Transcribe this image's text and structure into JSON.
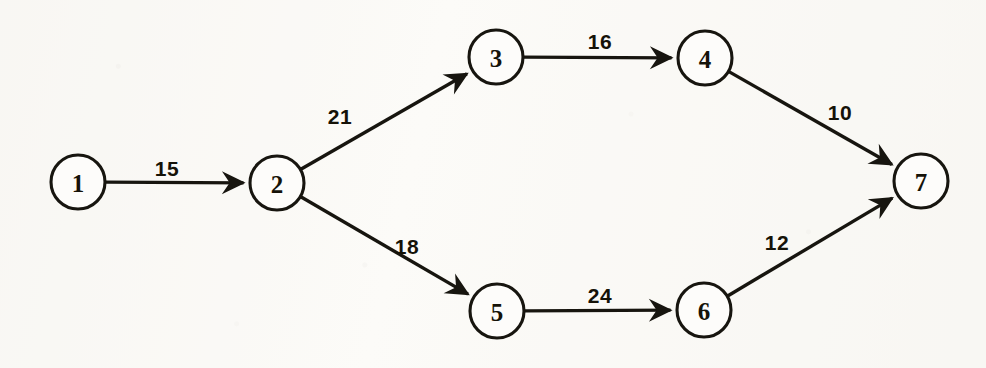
{
  "figure": {
    "kind": "directed-network-diagram",
    "canvas": {
      "width": 986,
      "height": 368
    },
    "background_color": "#fcfbf8",
    "ink_color": "#17150f"
  },
  "chart_data": {
    "type": "diagram",
    "title": "",
    "xlabel": "",
    "ylabel": "",
    "node_radius": 27,
    "nodes": [
      {
        "id": "1",
        "label": "1",
        "x": 78,
        "y": 182
      },
      {
        "id": "2",
        "label": "2",
        "x": 277,
        "y": 183
      },
      {
        "id": "3",
        "label": "3",
        "x": 496,
        "y": 57
      },
      {
        "id": "4",
        "label": "4",
        "x": 705,
        "y": 58
      },
      {
        "id": "5",
        "label": "5",
        "x": 497,
        "y": 311
      },
      {
        "id": "6",
        "label": "6",
        "x": 704,
        "y": 310
      },
      {
        "id": "7",
        "label": "7",
        "x": 921,
        "y": 181
      }
    ],
    "edges": [
      {
        "from": "1",
        "to": "2",
        "weight": "15",
        "label_x": 167,
        "label_y": 168
      },
      {
        "from": "2",
        "to": "3",
        "weight": "21",
        "label_x": 340,
        "label_y": 116
      },
      {
        "from": "3",
        "to": "4",
        "weight": "16",
        "label_x": 600,
        "label_y": 41
      },
      {
        "from": "4",
        "to": "7",
        "weight": "10",
        "label_x": 840,
        "label_y": 112
      },
      {
        "from": "2",
        "to": "5",
        "weight": "18",
        "label_x": 407,
        "label_y": 246
      },
      {
        "from": "5",
        "to": "6",
        "weight": "24",
        "label_x": 600,
        "label_y": 295
      },
      {
        "from": "6",
        "to": "7",
        "weight": "12",
        "label_x": 777,
        "label_y": 242
      }
    ]
  }
}
